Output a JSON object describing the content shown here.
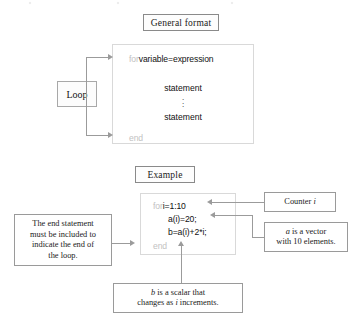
{
  "general_format": {
    "caption": "General format",
    "loop_label": "Loop",
    "code": {
      "keyword_for": "for",
      "header": "variable=expression",
      "statement_first": "statement",
      "statement_last": "statement",
      "ellipsis": "⋮",
      "keyword_end": "end"
    }
  },
  "example": {
    "caption": "Example",
    "code": {
      "keyword_for": "for",
      "header": "i=1:10",
      "line_2": "a(i)=20;",
      "line_3": "b=a(i)+2*i;",
      "keyword_end": "end"
    },
    "annotations": {
      "counter": {
        "text_before": "Counter ",
        "italic": "i",
        "text_after": ""
      },
      "vector": {
        "line1_italic": "a",
        "line1_rest": " is a vector",
        "line2": "with 10 elements."
      },
      "end_statement": {
        "line1": "The end statement",
        "line2": "must be included to",
        "line3": "indicate the end of",
        "line4": "the loop."
      },
      "scalar": {
        "line1_italic": "b",
        "line1_rest": " is a scalar that",
        "line2_before": "changes as ",
        "line2_italic": "i",
        "line2_after": " increments."
      }
    }
  },
  "colors": {
    "keyword_gray": "#c2c2c2",
    "connector_gray": "#9b9b9b",
    "panel_border": "#d9d9d9",
    "box_border": "#9a9a9a",
    "text": "#1a1a1a"
  }
}
